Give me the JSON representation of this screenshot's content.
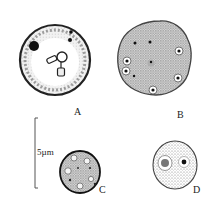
{
  "figure": {
    "panels": [
      {
        "id": "A",
        "label": "A",
        "description": "large round cell with dark nucleus and stalked inclusions"
      },
      {
        "id": "B",
        "label": "B",
        "description": "multinucleate rounded cell with ~8 ringed nuclei"
      },
      {
        "id": "C",
        "label": "C",
        "description": "small granular cell with vacuoles"
      },
      {
        "id": "D",
        "label": "D",
        "description": "small round cell with two nuclear bodies"
      }
    ],
    "scale_bar": {
      "label": "5µm"
    }
  }
}
